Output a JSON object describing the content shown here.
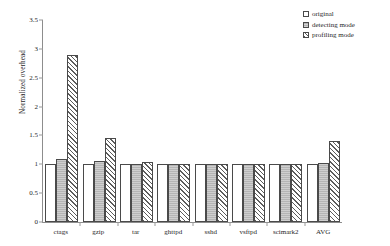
{
  "chart_data": {
    "type": "bar",
    "title": "",
    "xlabel": "",
    "ylabel": "Normalized overhead",
    "ylim": [
      0,
      3.5
    ],
    "yticks": [
      0,
      0.5,
      1,
      1.5,
      2,
      2.5,
      3,
      3.5
    ],
    "ytick_labels": [
      "0",
      "0.5",
      "1",
      "1.5",
      "2",
      "2.5",
      "3",
      "3.5"
    ],
    "grid": false,
    "legend_position": "top-right",
    "categories": [
      "ctags",
      "gzip",
      "tar",
      "ghttpd",
      "sshd",
      "vsftpd",
      "scimark2",
      "AVG"
    ],
    "series": [
      {
        "name": "original",
        "values": [
          1.0,
          1.0,
          1.0,
          1.0,
          1.0,
          1.0,
          1.0,
          1.0
        ]
      },
      {
        "name": "detecting mode",
        "values": [
          1.1,
          1.05,
          1.01,
          1.0,
          1.0,
          1.0,
          1.0,
          1.02
        ]
      },
      {
        "name": "profiling mode",
        "values": [
          2.9,
          1.45,
          1.04,
          1.01,
          1.01,
          1.01,
          1.01,
          1.4
        ]
      }
    ]
  }
}
